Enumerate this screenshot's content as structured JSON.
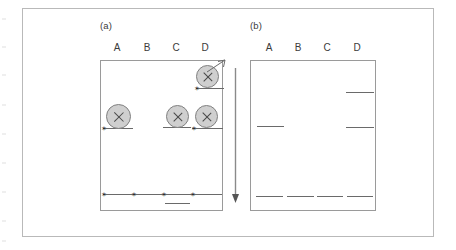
{
  "figure": {
    "panels": [
      {
        "id": "panel-a",
        "caption": "(a)",
        "lane_labels": [
          "A",
          "B",
          "C",
          "D"
        ],
        "spots": [
          {
            "lane": "D",
            "position": "top",
            "marker": "x"
          },
          {
            "lane": "A",
            "position": "middle",
            "marker": "x"
          },
          {
            "lane": "C",
            "position": "middle",
            "marker": "x"
          },
          {
            "lane": "D",
            "position": "middle",
            "marker": "x"
          }
        ],
        "star_markers": [
          {
            "lane": "D",
            "position": "top"
          },
          {
            "lane": "A",
            "position": "middle"
          },
          {
            "lane": "D",
            "position": "middle"
          },
          {
            "lane": "A",
            "position": "bottom"
          },
          {
            "lane": "B",
            "position": "bottom"
          },
          {
            "lane": "C",
            "position": "bottom"
          },
          {
            "lane": "D",
            "position": "bottom"
          }
        ],
        "bands": [
          {
            "lane": "D",
            "position": "top"
          },
          {
            "lane": "A",
            "position": "middle"
          },
          {
            "lane": "C",
            "position": "middle"
          },
          {
            "lane": "D",
            "position": "middle"
          },
          {
            "lane": "A",
            "position": "bottom"
          },
          {
            "lane": "B",
            "position": "bottom"
          },
          {
            "lane": "C",
            "position": "bottom"
          },
          {
            "lane": "D",
            "position": "bottom"
          },
          {
            "lane": "C",
            "position": "below-bottom"
          }
        ],
        "pointer": {
          "from": "spot-D-top",
          "direction": "up-right"
        }
      },
      {
        "id": "panel-b",
        "caption": "(b)",
        "lane_labels": [
          "A",
          "B",
          "C",
          "D"
        ],
        "spots": [],
        "star_markers": [],
        "bands": [
          {
            "lane": "D",
            "position": "top"
          },
          {
            "lane": "A",
            "position": "middle"
          },
          {
            "lane": "D",
            "position": "middle"
          },
          {
            "lane": "A",
            "position": "bottom"
          },
          {
            "lane": "B",
            "position": "bottom"
          },
          {
            "lane": "C",
            "position": "bottom"
          },
          {
            "lane": "D",
            "position": "bottom"
          }
        ]
      }
    ],
    "process_arrow": {
      "direction": "down"
    },
    "colors": {
      "spot_fill": "#cfcfcf",
      "spot_stroke": "#808080",
      "band": "#6a6a6a",
      "box_border": "#9a9a9a",
      "frame_border": "#b9b9b9",
      "text": "#3b3b3b",
      "marker": "#2e2e2e"
    },
    "glyphs": {
      "star": "✶"
    }
  }
}
